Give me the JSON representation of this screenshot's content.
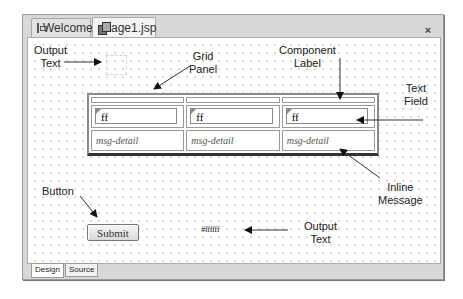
{
  "editor": {
    "tabs": [
      {
        "label": "Welcome",
        "icon": "welcome-icon",
        "active": false
      },
      {
        "label": "Page1.jsp",
        "icon": "jsp-page-icon",
        "active": true
      }
    ],
    "close_icon": "×",
    "bottom_tabs": [
      {
        "label": "Design",
        "active": true
      },
      {
        "label": "Source",
        "active": false
      }
    ]
  },
  "canvas": {
    "grid_panel": {
      "columns": 3,
      "labels": [
        "",
        "",
        ""
      ],
      "text_fields": [
        "ff",
        "ff",
        "ff"
      ],
      "messages": [
        "msg-detail",
        "msg-detail",
        "msg-detail"
      ]
    },
    "button": {
      "label": "Submit"
    },
    "output_text": {
      "value": "#ffffff"
    }
  },
  "annotations": {
    "output_text_top": "Output\nText",
    "grid_panel": "Grid\nPanel",
    "component_label": "Component\nLabel",
    "text_field": "Text\nField",
    "button": "Button",
    "inline_message": "Inline\nMessage",
    "output_text_bottom": "Output\nText"
  }
}
